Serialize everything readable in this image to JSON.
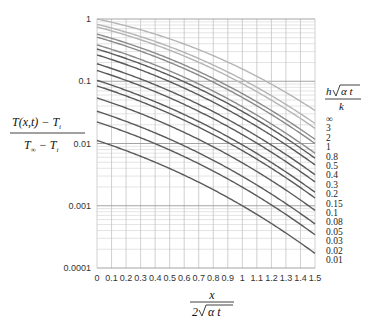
{
  "chart_data": {
    "type": "line",
    "title": "",
    "xlabel": "x / (2√(αt))",
    "ylabel": "(T(x,t) − T_i) / (T_∞ − T_i)",
    "xscale": "linear",
    "yscale": "log",
    "xlim": [
      0,
      1.5
    ],
    "ylim": [
      0.0001,
      1
    ],
    "grid": true,
    "x_ticks": [
      "0",
      "0.1",
      "0.2",
      "0.3",
      "0.4",
      "0.5",
      "0.6",
      "0.7",
      "0.8",
      "0.9",
      "1",
      "1.1",
      "1.2",
      "1.3",
      "1.4",
      "1.5"
    ],
    "y_ticks": [
      "1",
      "0.1",
      "0.01",
      "0.001",
      "0.0001"
    ],
    "legend_title": "h√(αt) / k",
    "legend_position": "right",
    "legend_entries": [
      "∞",
      "3",
      "2",
      "1",
      "0.8",
      "0.5",
      "0.4",
      "0.3",
      "0.2",
      "0.15",
      "0.1",
      "0.08",
      "0.05",
      "0.03",
      "0.02",
      "0.01"
    ],
    "x": [
      0,
      0.5,
      1.0,
      1.5
    ],
    "series": [
      {
        "name": "∞",
        "B": 1000000000.0,
        "values": [
          1.0,
          0.4795,
          0.1573,
          0.0339
        ]
      },
      {
        "name": "3",
        "B": 3,
        "values": [
          0.825,
          0.378,
          0.112,
          0.022
        ]
      },
      {
        "name": "2",
        "B": 2,
        "values": [
          0.745,
          0.328,
          0.094,
          0.018
        ]
      },
      {
        "name": "1",
        "B": 1,
        "values": [
          0.573,
          0.222,
          0.058,
          0.0117
        ]
      },
      {
        "name": "0.8",
        "B": 0.8,
        "values": [
          0.509,
          0.189,
          0.047,
          0.0093
        ]
      },
      {
        "name": "0.5",
        "B": 0.5,
        "values": [
          0.385,
          0.13,
          0.03,
          0.0057
        ]
      },
      {
        "name": "0.4",
        "B": 0.4,
        "values": [
          0.332,
          0.107,
          0.024,
          0.0045
        ]
      },
      {
        "name": "0.3",
        "B": 0.3,
        "values": [
          0.27,
          0.083,
          0.018,
          0.0033
        ]
      },
      {
        "name": "0.2",
        "B": 0.2,
        "values": [
          0.195,
          0.058,
          0.012,
          0.0022
        ]
      },
      {
        "name": "0.15",
        "B": 0.15,
        "values": [
          0.153,
          0.044,
          0.009,
          0.0016
        ]
      },
      {
        "name": "0.1",
        "B": 0.1,
        "values": [
          0.104,
          0.03,
          0.006,
          0.0011
        ]
      },
      {
        "name": "0.08",
        "B": 0.08,
        "values": [
          0.084,
          0.024,
          0.0048,
          0.00088
        ]
      },
      {
        "name": "0.05",
        "B": 0.05,
        "values": [
          0.054,
          0.015,
          0.003,
          0.00055
        ]
      },
      {
        "name": "0.03",
        "B": 0.03,
        "values": [
          0.033,
          0.009,
          0.0018,
          0.00033
        ]
      },
      {
        "name": "0.02",
        "B": 0.02,
        "values": [
          0.022,
          0.006,
          0.0012,
          0.00022
        ]
      },
      {
        "name": "0.01",
        "B": 0.01,
        "values": [
          0.0112,
          0.003,
          0.00061,
          0.00011
        ]
      }
    ],
    "colors": {
      "light_curves": "#b5b5b5",
      "dark_curves": "#5a5a5a",
      "grid_major": "#9a9a9a",
      "grid_minor": "#d8d8d8"
    }
  },
  "labels": {
    "y_numerator": "T(x,t) − T",
    "y_numerator_sub": "i",
    "y_denominator": "T",
    "y_denominator_sub1": "∞",
    "y_denominator_mid": " − T",
    "y_denominator_sub2": "i",
    "x_numerator": "x",
    "x_denominator_prefix": "2",
    "x_denominator_radicand": "α t",
    "legend_num_prefix": "h",
    "legend_num_radicand": "α t",
    "legend_den": "k"
  }
}
